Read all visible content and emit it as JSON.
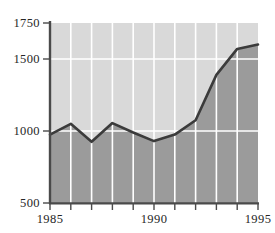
{
  "chart_data": {
    "type": "area",
    "title": "",
    "subtitle": "",
    "xlabel": "",
    "ylabel": "",
    "x": [
      1985,
      1986,
      1987,
      1988,
      1989,
      1990,
      1991,
      1992,
      1993,
      1994,
      1995
    ],
    "values": [
      975,
      1050,
      925,
      1055,
      990,
      930,
      975,
      1075,
      1390,
      1570,
      1600
    ],
    "series": [
      {
        "name": "series-1",
        "values": [
          975,
          1050,
          925,
          1055,
          990,
          930,
          975,
          1075,
          1390,
          1570,
          1600
        ]
      }
    ],
    "xlim": [
      1985,
      1995
    ],
    "ylim": [
      500,
      1750
    ],
    "y_ticks": [
      500,
      1000,
      1500,
      1750
    ],
    "y_tick_labels": [
      "500",
      "1000",
      "1500",
      "1750"
    ],
    "y_gridlines": [
      1000,
      1500
    ],
    "x_ticks": [
      1985,
      1986,
      1987,
      1988,
      1989,
      1990,
      1991,
      1992,
      1993,
      1994,
      1995
    ],
    "x_tick_labels": [
      "1985",
      "",
      "",
      "",
      "",
      "1990",
      "",
      "",
      "",
      "",
      "1995"
    ],
    "x_major_labels": [
      "1985",
      "1990",
      "1995"
    ],
    "grid": true,
    "legend": false,
    "legend_position": "none",
    "annotations": []
  },
  "style": {
    "plot_background": "#d8d8d8",
    "area_fill": "#9a9a9a",
    "line_color": "#3b3b3b",
    "gridline_color": "#ffffff",
    "axis_color": "#4a4a4a",
    "tick_color": "#4a4a4a",
    "label_color": "#262626",
    "page_background": "#ffffff"
  },
  "axes": {
    "y_axis_label_500": "500",
    "y_axis_label_1000": "1000",
    "y_axis_label_1500": "1500",
    "y_axis_label_1750": "1750",
    "x_axis_label_start": "1985",
    "x_axis_label_mid": "1990",
    "x_axis_label_end": "1995"
  }
}
